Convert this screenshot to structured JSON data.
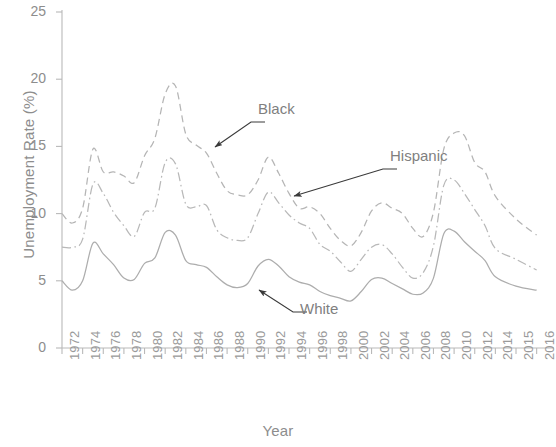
{
  "chart_data": {
    "type": "line",
    "title": "",
    "xlabel": "Year",
    "ylabel": "Unemployment Rate (%)",
    "xlim": [
      1972,
      2016
    ],
    "ylim": [
      0,
      25
    ],
    "yticks": [
      0,
      5,
      10,
      15,
      20,
      25
    ],
    "xticks": [
      1972,
      1974,
      1976,
      1978,
      1980,
      1982,
      1984,
      1986,
      1988,
      1990,
      1992,
      1994,
      1996,
      1998,
      2000,
      2002,
      2004,
      2006,
      2008,
      2010,
      2012,
      2014,
      2015,
      2016
    ],
    "xtick_labels": [
      "1972",
      "1974",
      "1976",
      "1978",
      "1980",
      "1982",
      "1984",
      "1986",
      "1988",
      "1990",
      "1992",
      "1994",
      "1996",
      "1998",
      "2000",
      "2002",
      "2004",
      "2006",
      "2008",
      "2010",
      "2012",
      "2014",
      "2015",
      "2016"
    ],
    "ytick_labels": [
      "0",
      "5",
      "10",
      "15",
      "20",
      "25"
    ],
    "grid": false,
    "legend_position": "inline-annotations",
    "x": [
      1972,
      1973,
      1974,
      1975,
      1976,
      1977,
      1978,
      1979,
      1980,
      1981,
      1982,
      1983,
      1984,
      1985,
      1986,
      1987,
      1988,
      1989,
      1990,
      1991,
      1992,
      1993,
      1994,
      1995,
      1996,
      1997,
      1998,
      1999,
      2000,
      2001,
      2002,
      2003,
      2004,
      2005,
      2006,
      2007,
      2008,
      2009,
      2010,
      2011,
      2012,
      2013,
      2014,
      2015,
      2016
    ],
    "series": [
      {
        "name": "Black",
        "line_style": "dashed",
        "color": "#b5b5b5",
        "values": [
          10.0,
          9.3,
          10.4,
          14.8,
          13.1,
          13.1,
          12.8,
          12.3,
          14.3,
          15.6,
          18.9,
          19.5,
          15.9,
          15.1,
          14.5,
          13.0,
          11.7,
          11.4,
          11.4,
          12.5,
          14.2,
          13.0,
          11.5,
          10.4,
          10.5,
          10.0,
          8.9,
          8.0,
          7.6,
          8.6,
          10.2,
          10.8,
          10.4,
          10.0,
          8.9,
          8.3,
          10.1,
          14.8,
          16.0,
          15.8,
          13.8,
          13.1,
          11.3,
          9.6,
          8.4
        ]
      },
      {
        "name": "Hispanic",
        "line_style": "dashdot",
        "color": "#b8b8b8",
        "values": [
          7.5,
          7.5,
          8.1,
          12.2,
          11.5,
          10.1,
          9.1,
          8.3,
          10.1,
          10.4,
          13.8,
          13.7,
          10.7,
          10.5,
          10.6,
          8.8,
          8.2,
          8.0,
          8.2,
          10.0,
          11.6,
          10.8,
          9.9,
          9.3,
          8.9,
          7.7,
          7.2,
          6.4,
          5.7,
          6.6,
          7.5,
          7.7,
          7.0,
          6.0,
          5.2,
          5.6,
          7.6,
          12.1,
          12.5,
          11.5,
          10.3,
          9.1,
          7.4,
          6.6,
          5.8
        ]
      },
      {
        "name": "White",
        "line_style": "solid",
        "color": "#adadad",
        "values": [
          5.0,
          4.3,
          5.0,
          7.8,
          7.0,
          6.2,
          5.2,
          5.1,
          6.3,
          6.7,
          8.6,
          8.4,
          6.5,
          6.2,
          6.0,
          5.3,
          4.7,
          4.5,
          4.8,
          6.1,
          6.6,
          6.1,
          5.3,
          4.9,
          4.7,
          4.2,
          3.9,
          3.7,
          3.5,
          4.2,
          5.1,
          5.2,
          4.8,
          4.4,
          4.0,
          4.1,
          5.2,
          8.5,
          8.7,
          7.9,
          7.2,
          6.5,
          5.3,
          4.6,
          4.3
        ]
      }
    ],
    "annotations": [
      {
        "label": "Black",
        "label_x": 258,
        "label_y": 110,
        "arrow_from_x": 251,
        "arrow_from_y": 122,
        "arrow_to_x": 215,
        "arrow_to_y": 147
      },
      {
        "label": "Hispanic",
        "label_x": 390,
        "label_y": 157,
        "arrow_from_x": 383,
        "arrow_from_y": 169,
        "arrow_to_x": 294,
        "arrow_to_y": 196
      },
      {
        "label": "White",
        "label_x": 300,
        "label_y": 310,
        "arrow_from_x": 293,
        "arrow_from_y": 312,
        "arrow_to_x": 259,
        "arrow_to_y": 290
      }
    ]
  }
}
